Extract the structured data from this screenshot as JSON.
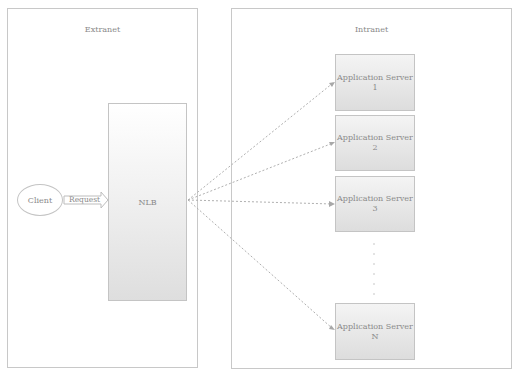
{
  "zones": {
    "extranet": {
      "title": "Extranet"
    },
    "intranet": {
      "title": "Intranet"
    }
  },
  "nodes": {
    "client": {
      "label": "Client"
    },
    "nlb": {
      "label": "NLB"
    },
    "request": {
      "label": "Request"
    },
    "servers": [
      {
        "name": "Application Server",
        "index": "1"
      },
      {
        "name": "Application Server",
        "index": "2"
      },
      {
        "name": "Application Server",
        "index": "3"
      },
      {
        "name": "Application Server",
        "index": "N"
      }
    ]
  },
  "colors": {
    "border": "#c4c4c4",
    "text": "#8a8a8a",
    "arrow": "#b0b0b0"
  }
}
